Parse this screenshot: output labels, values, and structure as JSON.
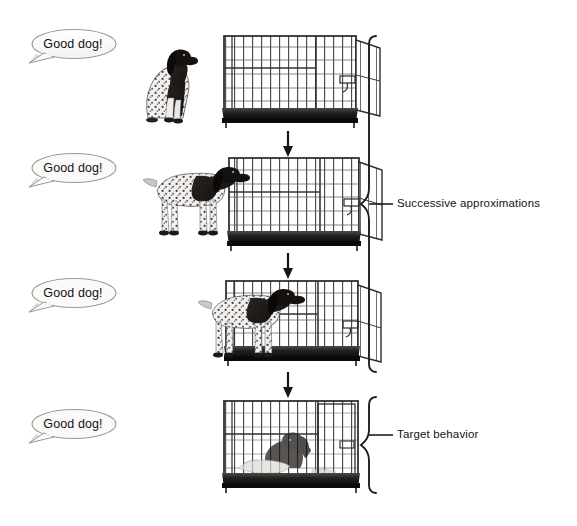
{
  "figure": {
    "type": "instructional-diagram",
    "topic": "Operant conditioning: shaping a dog to enter a crate",
    "background_color": "#ffffff",
    "ink_color": "#1a1a1a"
  },
  "rows": [
    {
      "id": "row-1",
      "speech": "Good dog!",
      "dog_state": "sitting-outside-crate",
      "crate_state": "empty-door-open",
      "arrow_below": true
    },
    {
      "id": "row-2",
      "speech": "Good dog!",
      "dog_state": "standing-at-crate-entrance",
      "crate_state": "empty-door-open",
      "arrow_below": true
    },
    {
      "id": "row-3",
      "speech": "Good dog!",
      "dog_state": "standing-partly-inside-crate",
      "crate_state": "occupied-door-open",
      "arrow_below": true
    },
    {
      "id": "row-4",
      "speech": "Good dog!",
      "dog_state": "lying-down-inside-crate",
      "crate_state": "occupied-door-closed",
      "arrow_below": false
    }
  ],
  "brackets": [
    {
      "id": "bracket-successive-approximations",
      "label": "Successive approximations",
      "spans_rows": [
        "row-1",
        "row-2",
        "row-3"
      ]
    },
    {
      "id": "bracket-target-behavior",
      "label": "Target behavior",
      "spans_rows": [
        "row-4"
      ]
    }
  ],
  "arrows": [
    {
      "id": "arrow-1-to-2",
      "direction": "down"
    },
    {
      "id": "arrow-2-to-3",
      "direction": "down"
    },
    {
      "id": "arrow-3-to-4",
      "direction": "down"
    }
  ]
}
